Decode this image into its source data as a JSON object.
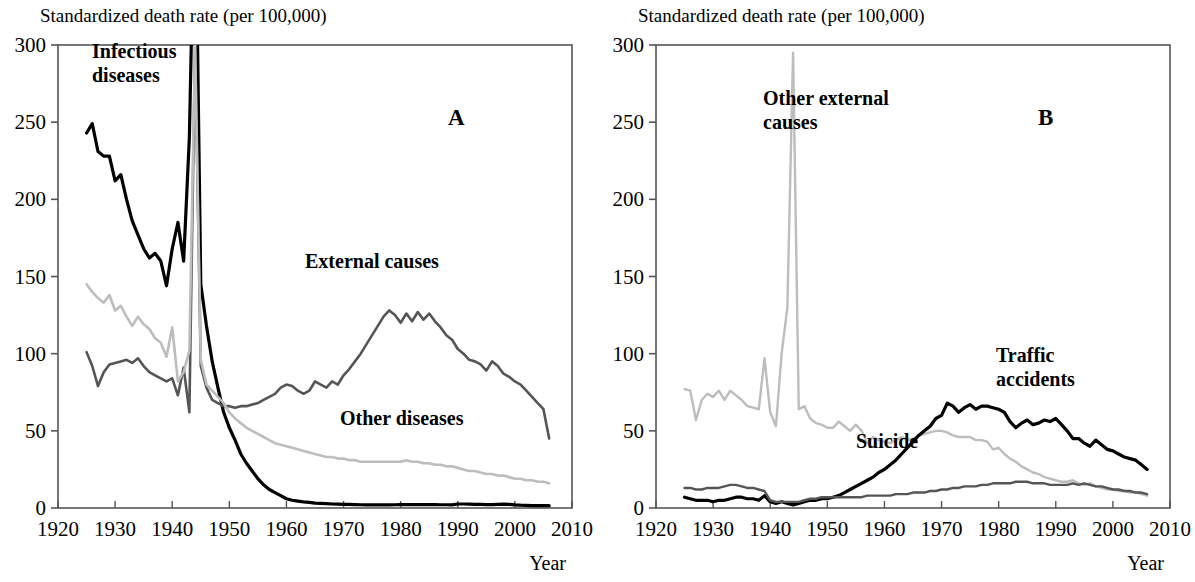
{
  "figure": {
    "width": 1195,
    "height": 582,
    "background": "#ffffff"
  },
  "panels": [
    {
      "id": "A",
      "letter": "A",
      "axis_title": "Standardized death rate (per 100,000)",
      "xaxis_name": "Year",
      "series_labels": [
        {
          "name": "infectious-diseases",
          "text": "Infectious\ndiseases",
          "x": 92,
          "y": 58
        },
        {
          "name": "external-causes",
          "text": "External causes",
          "x": 305,
          "y": 268
        },
        {
          "name": "other-diseases",
          "text": "Other diseases",
          "x": 340,
          "y": 425
        }
      ]
    },
    {
      "id": "B",
      "letter": "B",
      "axis_title": "Standardized death rate (per 100,000)",
      "xaxis_name": "Year",
      "series_labels": [
        {
          "name": "other-external-causes",
          "text": "Other external\ncauses",
          "x": 165,
          "y": 105
        },
        {
          "name": "traffic-accidents",
          "text": "Traffic\naccidents",
          "x": 398,
          "y": 362
        },
        {
          "name": "suicide",
          "text": "Suicide",
          "x": 258,
          "y": 448
        }
      ]
    }
  ],
  "colors": {
    "black": "#000000",
    "dark_gray": "#555555",
    "light_gray": "#bdbdbd",
    "axis": "#555555",
    "text": "#000000"
  },
  "chart_data": [
    {
      "type": "line",
      "panel": "A",
      "title": "Standardized death rate (per 100,000)",
      "xlabel": "Year",
      "ylabel": "Standardized death rate (per 100,000)",
      "xlim": [
        1920,
        2010
      ],
      "ylim": [
        0,
        300
      ],
      "xticks": [
        1920,
        1930,
        1940,
        1950,
        1960,
        1970,
        1980,
        1990,
        2000,
        2010
      ],
      "yticks": [
        0,
        50,
        100,
        150,
        200,
        250,
        300
      ],
      "grid": false,
      "legend": "inline-annotations",
      "x": [
        1925,
        1926,
        1927,
        1928,
        1929,
        1930,
        1931,
        1932,
        1933,
        1934,
        1935,
        1936,
        1937,
        1938,
        1939,
        1940,
        1941,
        1942,
        1943,
        1944,
        1945,
        1946,
        1947,
        1948,
        1949,
        1950,
        1951,
        1952,
        1953,
        1954,
        1955,
        1956,
        1957,
        1958,
        1959,
        1960,
        1961,
        1962,
        1963,
        1964,
        1965,
        1966,
        1967,
        1968,
        1969,
        1970,
        1971,
        1972,
        1973,
        1974,
        1975,
        1976,
        1977,
        1978,
        1979,
        1980,
        1981,
        1982,
        1983,
        1984,
        1985,
        1986,
        1987,
        1988,
        1989,
        1990,
        1991,
        1992,
        1993,
        1994,
        1995,
        1996,
        1997,
        1998,
        1999,
        2000,
        2001,
        2002,
        2003,
        2004,
        2005,
        2006
      ],
      "series": [
        {
          "name": "Infectious diseases",
          "color": "#000000",
          "width": 3.2,
          "values": [
            243,
            249,
            231,
            228,
            228,
            212,
            216,
            200,
            186,
            177,
            168,
            162,
            165,
            160,
            144,
            168,
            185,
            160,
            240,
            420,
            145,
            118,
            95,
            78,
            62,
            52,
            44,
            35,
            29,
            24,
            19,
            15,
            12,
            10,
            8,
            6,
            5,
            4.5,
            4,
            3.6,
            3.2,
            3,
            2.8,
            2.6,
            2.5,
            2.4,
            2.3,
            2.2,
            2.1,
            2,
            2,
            2,
            2,
            2,
            2.1,
            2.2,
            2.2,
            2.2,
            2.2,
            2.2,
            2.2,
            2.2,
            2.1,
            2.1,
            2,
            2.6,
            2.6,
            2.5,
            2.4,
            2.3,
            2.2,
            2.2,
            2.4,
            2.5,
            2.3,
            2,
            1.8,
            1.7,
            1.6,
            1.6,
            1.5,
            1.5
          ]
        },
        {
          "name": "External causes",
          "color": "#555555",
          "width": 2.6,
          "values": [
            101,
            92,
            79,
            88,
            93,
            94,
            95,
            96,
            94,
            97,
            92,
            88,
            86,
            84,
            82,
            84,
            73,
            91,
            62,
            300,
            92,
            78,
            70,
            68,
            66,
            66,
            65,
            66,
            66,
            67,
            68,
            70,
            72,
            74,
            78,
            80,
            79,
            76,
            74,
            76,
            82,
            80,
            78,
            82,
            80,
            86,
            90,
            95,
            100,
            106,
            112,
            118,
            124,
            128,
            125,
            120,
            126,
            121,
            127,
            122,
            126,
            121,
            117,
            112,
            109,
            103,
            100,
            96,
            95,
            93,
            89,
            95,
            92,
            87,
            85,
            82,
            80,
            76,
            72,
            68,
            64,
            45
          ]
        },
        {
          "name": "Other diseases",
          "color": "#bdbdbd",
          "width": 2.6,
          "values": [
            145,
            140,
            136,
            133,
            138,
            128,
            131,
            124,
            118,
            124,
            119,
            116,
            110,
            107,
            98,
            117,
            82,
            88,
            102,
            300,
            96,
            80,
            76,
            72,
            68,
            62,
            58,
            55,
            52,
            50,
            48,
            46,
            44,
            42,
            41,
            40,
            39,
            38,
            37,
            36,
            35,
            34,
            33,
            33,
            32,
            32,
            31,
            31,
            30,
            30,
            30,
            30,
            30,
            30,
            30,
            30,
            31,
            30,
            30,
            29,
            29,
            28,
            28,
            27,
            27,
            26,
            25,
            24,
            24,
            23,
            22,
            22,
            21,
            21,
            20,
            19,
            19,
            18,
            18,
            17,
            17,
            16
          ]
        }
      ]
    },
    {
      "type": "line",
      "panel": "B",
      "title": "Standardized death rate (per 100,000)",
      "xlabel": "Year",
      "ylabel": "Standardized death rate (per 100,000)",
      "xlim": [
        1920,
        2010
      ],
      "ylim": [
        0,
        300
      ],
      "xticks": [
        1920,
        1930,
        1940,
        1950,
        1960,
        1970,
        1980,
        1990,
        2000,
        2010
      ],
      "yticks": [
        0,
        50,
        100,
        150,
        200,
        250,
        300
      ],
      "grid": false,
      "legend": "inline-annotations",
      "x": [
        1925,
        1926,
        1927,
        1928,
        1929,
        1930,
        1931,
        1932,
        1933,
        1934,
        1935,
        1936,
        1937,
        1938,
        1939,
        1940,
        1941,
        1942,
        1943,
        1944,
        1945,
        1946,
        1947,
        1948,
        1949,
        1950,
        1951,
        1952,
        1953,
        1954,
        1955,
        1956,
        1957,
        1958,
        1959,
        1960,
        1961,
        1962,
        1963,
        1964,
        1965,
        1966,
        1967,
        1968,
        1969,
        1970,
        1971,
        1972,
        1973,
        1974,
        1975,
        1976,
        1977,
        1978,
        1979,
        1980,
        1981,
        1982,
        1983,
        1984,
        1985,
        1986,
        1987,
        1988,
        1989,
        1990,
        1991,
        1992,
        1993,
        1994,
        1995,
        1996,
        1997,
        1998,
        1999,
        2000,
        2001,
        2002,
        2003,
        2004,
        2005,
        2006
      ],
      "series": [
        {
          "name": "Other external causes",
          "color": "#bdbdbd",
          "width": 2.4,
          "values": [
            77,
            76,
            57,
            70,
            74,
            72,
            76,
            70,
            76,
            73,
            70,
            66,
            65,
            64,
            97,
            62,
            53,
            100,
            130,
            295,
            64,
            66,
            58,
            55,
            54,
            52,
            52,
            56,
            53,
            50,
            54,
            50,
            42,
            46,
            44,
            43,
            42,
            44,
            46,
            44,
            45,
            47,
            48,
            49,
            50,
            50,
            49,
            47,
            46,
            46,
            46,
            44,
            44,
            43,
            38,
            39,
            35,
            32,
            30,
            27,
            25,
            23,
            22,
            20,
            19,
            18,
            17,
            17,
            18,
            16,
            15,
            16,
            14,
            13,
            12,
            12,
            11,
            11,
            10,
            10,
            9,
            8
          ]
        },
        {
          "name": "Traffic accidents",
          "color": "#000000",
          "width": 3.2,
          "values": [
            7,
            6,
            5,
            5,
            5,
            4,
            5,
            5,
            6,
            7,
            7,
            6,
            6,
            5,
            8,
            4,
            3,
            4,
            3,
            2,
            3,
            4,
            5,
            5,
            6,
            6,
            7,
            8,
            10,
            12,
            14,
            16,
            18,
            20,
            23,
            25,
            28,
            31,
            35,
            39,
            43,
            47,
            50,
            53,
            58,
            60,
            68,
            66,
            62,
            65,
            67,
            64,
            66,
            66,
            65,
            64,
            62,
            56,
            52,
            55,
            57,
            54,
            55,
            57,
            56,
            58,
            54,
            50,
            45,
            45,
            42,
            40,
            44,
            41,
            38,
            37,
            35,
            33,
            32,
            31,
            28,
            25
          ]
        },
        {
          "name": "Suicide",
          "color": "#555555",
          "width": 2.4,
          "values": [
            13,
            13,
            12,
            12,
            13,
            13,
            13,
            14,
            15,
            15,
            14,
            13,
            13,
            12,
            11,
            5,
            4,
            4,
            4,
            4,
            4,
            5,
            6,
            6,
            7,
            7,
            7,
            7,
            7,
            7,
            7,
            7,
            8,
            8,
            8,
            8,
            8,
            9,
            9,
            9,
            10,
            10,
            10,
            11,
            11,
            12,
            12,
            13,
            13,
            14,
            14,
            14,
            15,
            15,
            16,
            16,
            16,
            16,
            17,
            17,
            17,
            16,
            16,
            16,
            15,
            15,
            15,
            15,
            16,
            15,
            16,
            15,
            14,
            14,
            13,
            12,
            12,
            11,
            11,
            10,
            10,
            9
          ]
        }
      ]
    }
  ]
}
